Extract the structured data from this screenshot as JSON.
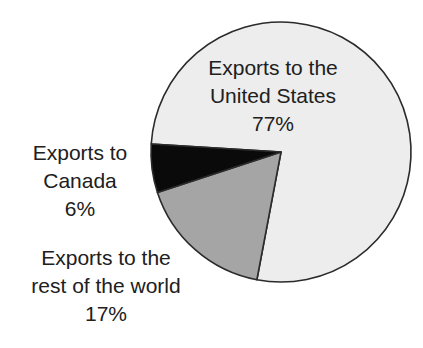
{
  "chart_data": {
    "type": "pie",
    "title": "",
    "legend_position": "none",
    "direction": "clockwise",
    "start_angle_deg": 273.5,
    "stroke_color": "#2b2b2b",
    "background_color": "#ffffff",
    "text_color": "#202020",
    "slices": [
      {
        "name": "united-states",
        "label": "Exports to the United States",
        "label_lines": [
          "Exports to the",
          "United States"
        ],
        "pct_label": "77%",
        "value": 77,
        "color": "#ededed",
        "label_placement": "inside-top"
      },
      {
        "name": "rest-of-world",
        "label": "Exports to the rest of the world",
        "label_lines": [
          "Exports to the",
          "rest of the world"
        ],
        "pct_label": "17%",
        "value": 17,
        "color": "#a5a5a5",
        "label_placement": "outside-bottom-left"
      },
      {
        "name": "canada",
        "label": "Exports to Canada",
        "label_lines": [
          "Exports to",
          "Canada"
        ],
        "pct_label": "6%",
        "value": 6,
        "color": "#0a0a0a",
        "label_placement": "outside-left"
      }
    ]
  }
}
